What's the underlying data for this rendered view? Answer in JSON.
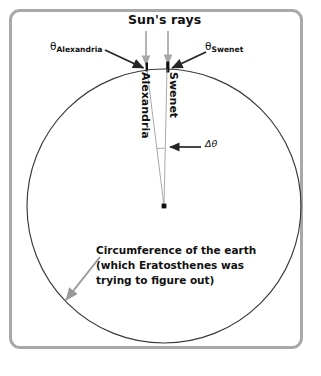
{
  "figure": {
    "title_label": "Sun's rays",
    "theta_alexandria": {
      "symbol": "θ",
      "subscript": "Alexandria"
    },
    "theta_swenet": {
      "symbol": "θ",
      "subscript": "Swenet"
    },
    "city_alexandria": "Alexandria",
    "city_swenet": "Swenet",
    "delta_theta": "Δθ",
    "caption": {
      "line1": "Circumference of the earth",
      "line2": "(which Eratosthenes was",
      "line3": "trying to figure out)"
    }
  },
  "colors": {
    "frame": "#a8a8a8",
    "circle": "#3a3a3a",
    "ray_arrow": "#a8a8a8",
    "pointer_arrow": "#262626",
    "caption_arrow": "#999999",
    "radius_line": "#9a9a9a",
    "gnomon": "#111111",
    "text": "#111111",
    "background": "#ffffff"
  },
  "geometry": {
    "circle_center_x": 164,
    "circle_center_y": 206,
    "circle_radius": 137,
    "earth_center_marker_x": 164,
    "earth_center_marker_y": 206,
    "alexandria_point_x": 147,
    "alexandria_point_y": 70,
    "swenet_point_x": 167,
    "swenet_point_y": 69,
    "sun_ray_1_x": 146,
    "sun_ray_2_x": 168,
    "delta_theta_arc_y": 148
  }
}
